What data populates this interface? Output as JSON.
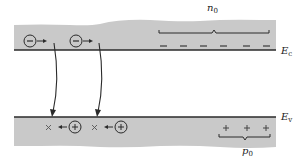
{
  "diagram": {
    "type": "energy-band-diagram",
    "colors": {
      "band_fill": "#c9c9c9",
      "line": "#2a2a2a",
      "background": "#ffffff"
    },
    "conduction_band": {
      "edge_label": "E",
      "edge_subscript": "c",
      "carrier_label": "n",
      "carrier_subscript": "0",
      "carrier_symbol": "−",
      "carrier_count": 6,
      "moving_carrier_symbol": "⊖",
      "moving_carriers": 2
    },
    "valence_band": {
      "edge_label": "E",
      "edge_subscript": "v",
      "carrier_label": "p",
      "carrier_subscript": "0",
      "carrier_symbol": "+",
      "carrier_count": 3,
      "moving_carrier_symbol": "⊕",
      "moving_carriers": 2,
      "vacancy_symbol": "×"
    },
    "transitions": 2
  }
}
